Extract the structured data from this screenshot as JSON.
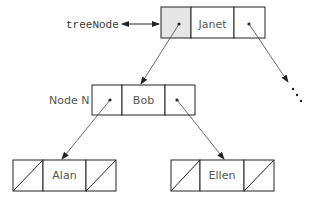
{
  "pointer_label": "treeNode",
  "node_label": "Node N",
  "nodes": {
    "root": {
      "value": "Janet"
    },
    "left": {
      "value": "Bob"
    },
    "left_left": {
      "value": "Alan"
    },
    "left_right": {
      "value": "Ellen"
    }
  },
  "colors": {
    "stroke": "#222222",
    "shaded": "#e6e6e6",
    "text": "#555555"
  }
}
